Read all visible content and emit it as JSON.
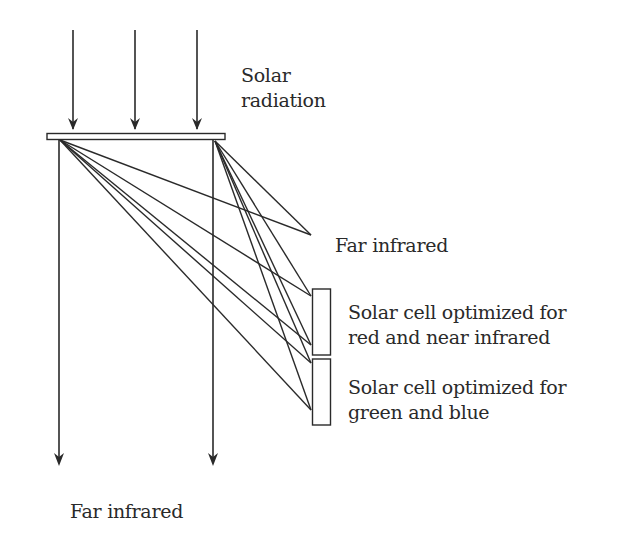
{
  "diagram": {
    "title": "",
    "labels": {
      "solar_radiation": [
        "Solar",
        "radiation"
      ],
      "far_infrared_reflected": "Far infrared",
      "cell_red": [
        "Solar cell optimized for",
        "red and near infrared"
      ],
      "cell_green": [
        "Solar cell optimized for",
        "green and blue"
      ],
      "far_infrared_transmitted": "Far infrared"
    },
    "colors": {
      "line": "#2a2a2a",
      "background": "#ffffff"
    },
    "elements": {
      "incoming_arrows": 3,
      "transmitted_arrows": 2,
      "solar_cells": 2,
      "ray_origins": 2,
      "ray_targets": 5
    }
  }
}
